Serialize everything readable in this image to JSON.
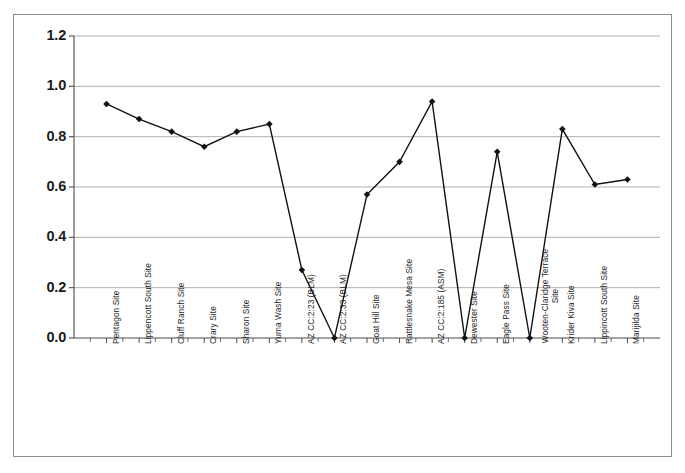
{
  "figure": {
    "background_color": "#ffffff",
    "frame_color": "#8d8d8d",
    "plot_border_color": "#4d4d4d",
    "gridline_color": "#a8a8a8",
    "series_color": "#111111"
  },
  "axis": {
    "y_ticks": [
      "0.0",
      "0.2",
      "0.4",
      "0.6",
      "0.8",
      "1.0",
      "1.2"
    ]
  },
  "chart_data": {
    "type": "line",
    "title": "",
    "subtitle": "",
    "xlabel": "",
    "ylabel": "",
    "ylim": [
      0.0,
      1.2
    ],
    "ytick_step": 0.2,
    "grid": true,
    "legend": false,
    "marker": "diamond",
    "categories": [
      "Pentagon Site",
      "Lippencott South Site",
      "Cluff Ranch Site",
      "Crary Site",
      "Sharon Site",
      "Yuma Wash Site",
      "AZ CC:2:23 (BLM)",
      "AZ CC:2:33 (BLM)",
      "Goat Hill Site",
      "Rattlesnake Mesa Site",
      "AZ CC:2:185 (ASM)",
      "Dewester Site",
      "Eagle Pass Site",
      "Wooten-Claridge Terrace Site",
      "Krider Kiva Site",
      "Lippincott South Site",
      "Marijilda Site"
    ],
    "values": [
      0.93,
      0.87,
      0.82,
      0.76,
      0.82,
      0.85,
      0.27,
      0.0,
      0.57,
      0.7,
      0.94,
      0.0,
      0.74,
      0.0,
      0.83,
      0.61,
      0.63
    ]
  }
}
